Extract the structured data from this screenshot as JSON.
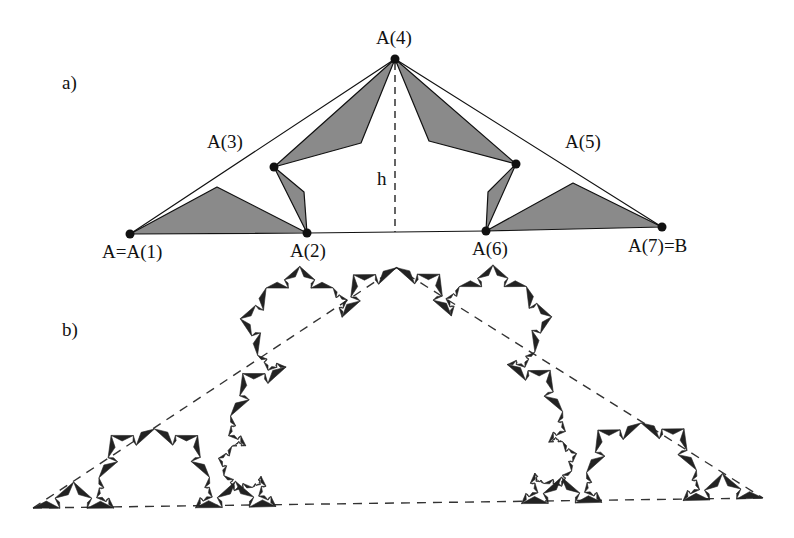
{
  "panels": [
    {
      "id": "a",
      "label": "a)",
      "description": "First generator step: segment A–B replaced by six segments through points A(1)..A(7), with shaded triangles and height h",
      "points": [
        {
          "name": "A(1)",
          "label": "A=A(1)"
        },
        {
          "name": "A(2)",
          "label": "A(2)"
        },
        {
          "name": "A(3)",
          "label": "A(3)"
        },
        {
          "name": "A(4)",
          "label": "A(4)"
        },
        {
          "name": "A(5)",
          "label": "A(5)"
        },
        {
          "name": "A(6)",
          "label": "A(6)"
        },
        {
          "name": "A(7)",
          "label": "A(7)=B"
        }
      ],
      "height_label": "h",
      "fill_color": "#8a8a8a",
      "stroke_color": "#111111"
    },
    {
      "id": "b",
      "label": "b)",
      "description": "Iterated fractal curve built from the same generator, inside dashed outline triangle",
      "iterations": 4,
      "stroke_color": "#111111"
    }
  ]
}
